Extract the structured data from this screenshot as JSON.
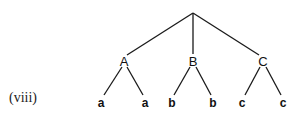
{
  "figure": {
    "item_label": "(viii)",
    "tree": {
      "root": {
        "label": "",
        "x": 193,
        "y": 13
      },
      "children": [
        {
          "label": "A",
          "x": 124,
          "y": 61,
          "leaves": [
            {
              "label": "a",
              "x": 101,
              "y": 104
            },
            {
              "label": "a",
              "x": 145,
              "y": 104
            }
          ]
        },
        {
          "label": "B",
          "x": 193,
          "y": 61,
          "leaves": [
            {
              "label": "b",
              "x": 172,
              "y": 104
            },
            {
              "label": "b",
              "x": 213,
              "y": 104
            }
          ]
        },
        {
          "label": "C",
          "x": 263,
          "y": 61,
          "leaves": [
            {
              "label": "c",
              "x": 242,
              "y": 104
            },
            {
              "label": "c",
              "x": 283,
              "y": 104
            }
          ]
        }
      ]
    }
  }
}
